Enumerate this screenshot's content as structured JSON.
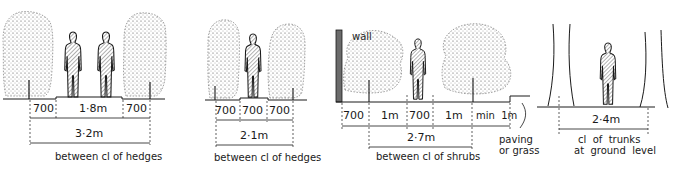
{
  "panels": [
    {
      "id": "hedges-wide",
      "dims": {
        "left": "700",
        "middle": "1·8m",
        "right": "700",
        "overall": "3·2m"
      },
      "caption": "between cl of hedges"
    },
    {
      "id": "hedges-narrow",
      "dims": {
        "left": "700",
        "middle": "700",
        "right": "700",
        "overall": "2·1m"
      },
      "caption": "between cl of hedges"
    },
    {
      "id": "shrubs-wall",
      "wall_label": "wall",
      "dims": {
        "a": "700",
        "b": "1m",
        "c": "700",
        "d": "1m",
        "e": "min  1m",
        "overall": "2·7m"
      },
      "caption": "between cl of shrubs",
      "side_note_1": "paving",
      "side_note_2": "or grass"
    },
    {
      "id": "trees",
      "dims": {
        "overall": "2·4m"
      },
      "caption_1": "cl  of  trunks",
      "caption_2": "at  ground  level"
    }
  ],
  "colors": {
    "ink": "#1a1a1a",
    "stipple": "#555555",
    "hatch": "#333333",
    "wall": "#6b6b6b",
    "background": "#ffffff"
  }
}
